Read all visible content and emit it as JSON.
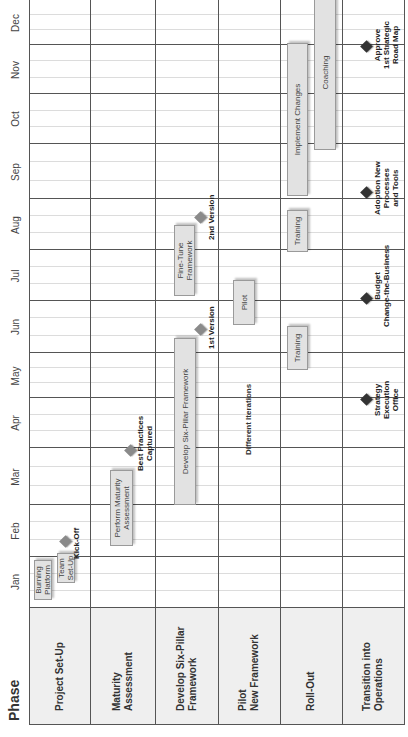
{
  "chart_data": {
    "type": "table",
    "subtype": "gantt",
    "orientation": "rotated -90deg (timeline runs bottom-to-top)",
    "header": {
      "phase_label": "Phase"
    },
    "months": [
      "Jan",
      "Feb",
      "Mar",
      "Apr",
      "May",
      "Jun",
      "Jul",
      "Aug",
      "Sep",
      "Oct",
      "Nov",
      "Dec"
    ],
    "phases": [
      {
        "name": "Project Set-Up"
      },
      {
        "name": "Maturity\nAssessment"
      },
      {
        "name": "Develop Six-Pillar\nFramework"
      },
      {
        "name": "Pilot\nNew Framework"
      },
      {
        "name": "Roll-Out"
      },
      {
        "name": "Transition into\nOperations"
      }
    ],
    "tasks": [
      {
        "phase": "Project Set-Up",
        "label": "Burning\nPlatform",
        "start_month": 1.05,
        "end_month": 1.8
      },
      {
        "phase": "Project Set-Up",
        "label": "Team\nSet-Up",
        "start_month": 1.5,
        "end_month": 2.1
      },
      {
        "phase": "Maturity Assessment",
        "label": "Perform Maturity\nAssessment",
        "start_month": 2.2,
        "end_month": 3.7
      },
      {
        "phase": "Develop Six-Pillar Framework",
        "label": "Develop Six-Pillar Framework",
        "start_month": 3.0,
        "end_month": 6.3
      },
      {
        "phase": "Develop Six-Pillar Framework",
        "label": "Fine-Tune\nFramework",
        "start_month": 7.1,
        "end_month": 8.5
      },
      {
        "phase": "Pilot New Framework",
        "label": "Pilot",
        "start_month": 6.55,
        "end_month": 7.4
      },
      {
        "phase": "Roll-Out",
        "label": "Training",
        "start_month": 5.65,
        "end_month": 6.55
      },
      {
        "phase": "Roll-Out",
        "label": "Training",
        "start_month": 8.0,
        "end_month": 8.8
      },
      {
        "phase": "Roll-Out",
        "label": "Implement Changes",
        "start_month": 8.95,
        "end_month": 11.95
      },
      {
        "phase": "Roll-Out",
        "label": "Coaching",
        "start_month": 10.1,
        "end_month": 13.0
      }
    ],
    "milestones": [
      {
        "phase": "Project Set-Up",
        "label": "Kick-Off",
        "month": 2.3,
        "style": "gray"
      },
      {
        "phase": "Maturity Assessment",
        "label": "Best Practices\nCaptured",
        "month": 3.95,
        "style": "gray"
      },
      {
        "phase": "Develop Six-Pillar Framework",
        "label": "1st Version",
        "month": 6.5,
        "style": "gray"
      },
      {
        "phase": "Develop Six-Pillar Framework",
        "label": "2nd Version",
        "month": 8.65,
        "style": "gray"
      },
      {
        "phase": "Transition into Operations",
        "label": "Strategy\nExecution\nOffice",
        "month": 4.0,
        "style": "dark"
      },
      {
        "phase": "Transition into Operations",
        "label": "Budget\nChange-the-Business",
        "month": 7.05,
        "style": "dark"
      },
      {
        "phase": "Transition into Operations",
        "label": "Adoption New\nProcesses\nand Tools",
        "month": 9.15,
        "style": "dark"
      },
      {
        "phase": "Transition into Operations",
        "label": "Approve\n1st Strategic\nRoad Map",
        "month": 12.0,
        "style": "dark"
      }
    ],
    "annotations": [
      {
        "phase": "Pilot New Framework",
        "text": "Different Iterations"
      }
    ],
    "colors": {
      "bar_fill": "#e2e2e2",
      "bar_border": "#9a9a9a",
      "milestone_gray": "#8a8a8a",
      "milestone_dark": "#333333",
      "header_fill": "#efefef",
      "grid": "#555555"
    }
  },
  "labels": {
    "phase": "Phase",
    "months": [
      "Jan",
      "Feb",
      "Mar",
      "Apr",
      "May",
      "Jun",
      "Jul",
      "Aug",
      "Sep",
      "Oct",
      "Nov",
      "Dec"
    ],
    "phases": [
      "Project Set-Up",
      "Maturity\nAssessment",
      "Develop Six-Pillar\nFramework",
      "Pilot\nNew Framework",
      "Roll-Out",
      "Transition into\nOperations"
    ],
    "tasks": {
      "burning_platform": "Burning\nPlatform",
      "team_setup": "Team\nSet-Up",
      "perform_maturity": "Perform Maturity\nAssessment",
      "develop_framework": "Develop Six-Pillar Framework",
      "fine_tune": "Fine-Tune\nFramework",
      "pilot": "Pilot",
      "training_1": "Training",
      "training_2": "Training",
      "implement_changes": "Implement Changes",
      "coaching": "Coaching"
    },
    "milestones": {
      "kickoff": "Kick-Off",
      "best_practices": "Best Practices\nCaptured",
      "version_1": "1st Version",
      "version_2": "2nd Version",
      "strategy_office": "Strategy\nExecution\nOffice",
      "budget": "Budget\nChange-the-Business",
      "adoption": "Adoption New\nProcesses\nand Tools",
      "approve": "Approve\n1st Strategic\nRoad Map"
    },
    "annotations": {
      "different_iterations": "Different Iterations"
    }
  }
}
